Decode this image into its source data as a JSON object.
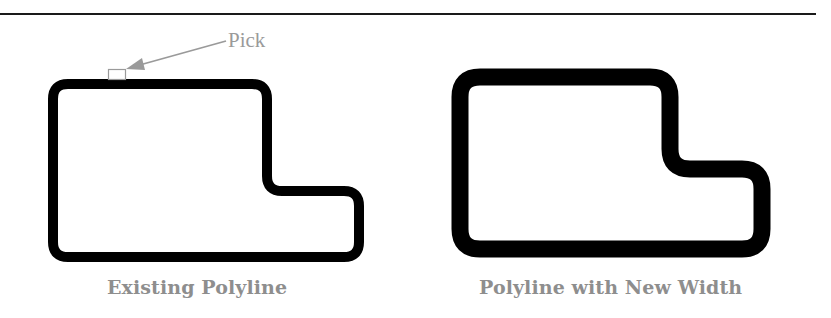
{
  "figure": {
    "annotation": {
      "label": "Pick",
      "color": "#9a9a9a"
    },
    "panels": [
      {
        "caption": "Existing Polyline",
        "stroke_width": 10,
        "stroke_color": "#000000"
      },
      {
        "caption": "Polyline with New Width",
        "stroke_width": 17,
        "stroke_color": "#000000"
      }
    ],
    "caption_color": "#8e8e8e",
    "rule_color": "#1a1a1a"
  }
}
